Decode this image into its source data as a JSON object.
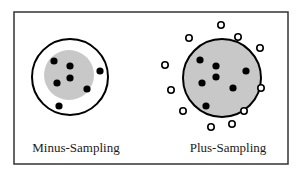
{
  "frame": {
    "x": 14,
    "y": 12,
    "width": 274,
    "height": 152,
    "stroke": "#333333"
  },
  "colors": {
    "gray_fill": "#c8c8c8",
    "dot": "#000000",
    "open_circle_stroke": "#000000",
    "outline": "#000000"
  },
  "panels": [
    {
      "id": "minus",
      "label": "Minus-Sampling",
      "label_pos": {
        "x": 76,
        "y": 152
      },
      "outer_circle": {
        "cx": 70,
        "cy": 77,
        "r": 38
      },
      "gray_region": {
        "cx": 69,
        "cy": 75,
        "r": 25
      },
      "filled_points": [
        {
          "x": 54,
          "y": 61
        },
        {
          "x": 70,
          "y": 66
        },
        {
          "x": 70,
          "y": 78
        },
        {
          "x": 57,
          "y": 83
        },
        {
          "x": 87,
          "y": 89
        },
        {
          "x": 59,
          "y": 106
        },
        {
          "x": 100,
          "y": 71
        }
      ],
      "open_points": []
    },
    {
      "id": "plus",
      "label": "Plus-Sampling",
      "label_pos": {
        "x": 228,
        "y": 152
      },
      "outer_circle": {
        "cx": 222,
        "cy": 78,
        "r": 39
      },
      "gray_region": {
        "cx": 222,
        "cy": 78,
        "r": 39
      },
      "filled_points": [
        {
          "x": 200,
          "y": 60
        },
        {
          "x": 216,
          "y": 66
        },
        {
          "x": 216,
          "y": 77
        },
        {
          "x": 202,
          "y": 83
        },
        {
          "x": 233,
          "y": 88
        },
        {
          "x": 206,
          "y": 106
        },
        {
          "x": 246,
          "y": 71
        }
      ],
      "open_points": [
        {
          "x": 221,
          "y": 25
        },
        {
          "x": 189,
          "y": 38
        },
        {
          "x": 238,
          "y": 37
        },
        {
          "x": 260,
          "y": 48
        },
        {
          "x": 165,
          "y": 65
        },
        {
          "x": 171,
          "y": 90
        },
        {
          "x": 261,
          "y": 88
        },
        {
          "x": 183,
          "y": 111
        },
        {
          "x": 244,
          "y": 111
        },
        {
          "x": 211,
          "y": 127
        },
        {
          "x": 232,
          "y": 124
        }
      ]
    }
  ]
}
